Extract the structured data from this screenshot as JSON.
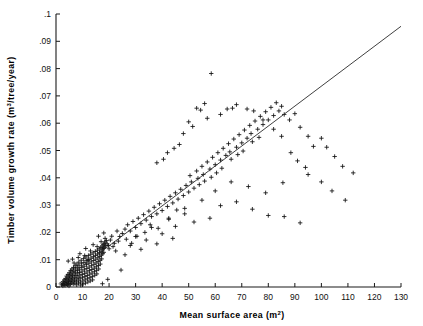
{
  "chart_data": {
    "type": "scatter",
    "title": "",
    "xlabel": "Mean surface area (m2)",
    "xlabel_base": "Mean surface area (m",
    "xlabel_sup": "2",
    "xlabel_tail": ")",
    "ylabel": "Timber volume growth rate (m3/tree/year)",
    "ylabel_base": "Timber volume growth rate (m",
    "ylabel_sup": "3",
    "ylabel_tail": "/tree/year)",
    "xlim": [
      0,
      130
    ],
    "ylim": [
      0,
      0.1
    ],
    "grid": false,
    "legend": null,
    "marker": "plus",
    "xticks": [
      0,
      10,
      20,
      30,
      40,
      50,
      60,
      70,
      80,
      90,
      100,
      110,
      120,
      130
    ],
    "xticklabels": [
      "0",
      "10",
      "20",
      "30",
      "40",
      "50",
      "60",
      "70",
      "80",
      "90",
      "100",
      "110",
      "120",
      "130"
    ],
    "yticks": [
      0,
      0.01,
      0.02,
      0.03,
      0.04,
      0.05,
      0.06,
      0.07,
      0.08,
      0.09,
      0.1
    ],
    "yticklabels": [
      "0",
      ".01",
      ".02",
      ".03",
      ".04",
      ".05",
      ".06",
      ".07",
      ".08",
      ".09",
      ".1"
    ],
    "fit_line": {
      "type": "linear",
      "x_start": 1.0,
      "y_start": 0.0012,
      "x_end": 130.0,
      "y_end": 0.0955,
      "slope": 0.000731,
      "intercept": 0.00047
    },
    "points": [
      [
        2.1,
        0.0008
      ],
      [
        2.4,
        0.0012
      ],
      [
        2.6,
        0.0004
      ],
      [
        2.8,
        0.0019
      ],
      [
        3.0,
        0.001
      ],
      [
        3.1,
        0.0026
      ],
      [
        3.3,
        0.0015
      ],
      [
        3.4,
        0.0006
      ],
      [
        3.6,
        0.0031
      ],
      [
        3.7,
        0.0021
      ],
      [
        3.9,
        0.0011
      ],
      [
        4.0,
        0.004
      ],
      [
        4.1,
        0.0028
      ],
      [
        4.2,
        0.0017
      ],
      [
        4.3,
        0.0008
      ],
      [
        4.5,
        0.0046
      ],
      [
        4.6,
        0.0034
      ],
      [
        4.7,
        0.0023
      ],
      [
        4.8,
        0.0013
      ],
      [
        4.9,
        0.0004
      ],
      [
        5.0,
        0.0052
      ],
      [
        5.1,
        0.0041
      ],
      [
        5.2,
        0.003
      ],
      [
        5.3,
        0.002
      ],
      [
        5.4,
        0.001
      ],
      [
        5.5,
        0.006
      ],
      [
        5.6,
        0.0048
      ],
      [
        5.7,
        0.0037
      ],
      [
        5.8,
        0.0026
      ],
      [
        5.9,
        0.0015
      ],
      [
        6.0,
        0.0066
      ],
      [
        6.1,
        0.0055
      ],
      [
        6.2,
        0.0043
      ],
      [
        6.3,
        0.0032
      ],
      [
        6.4,
        0.0021
      ],
      [
        6.5,
        0.0011
      ],
      [
        6.6,
        0.0071
      ],
      [
        6.7,
        0.0059
      ],
      [
        6.8,
        0.0048
      ],
      [
        6.9,
        0.0036
      ],
      [
        7.0,
        0.0025
      ],
      [
        7.1,
        0.0014
      ],
      [
        7.2,
        0.0078
      ],
      [
        7.3,
        0.0066
      ],
      [
        7.4,
        0.0054
      ],
      [
        7.5,
        0.0042
      ],
      [
        7.6,
        0.003
      ],
      [
        7.7,
        0.0019
      ],
      [
        7.8,
        0.0008
      ],
      [
        7.9,
        0.0084
      ],
      [
        8.0,
        0.0072
      ],
      [
        8.1,
        0.006
      ],
      [
        8.2,
        0.0048
      ],
      [
        8.3,
        0.0036
      ],
      [
        8.4,
        0.0025
      ],
      [
        8.5,
        0.0014
      ],
      [
        8.6,
        0.0091
      ],
      [
        8.7,
        0.0078
      ],
      [
        8.8,
        0.0065
      ],
      [
        8.9,
        0.0053
      ],
      [
        9.0,
        0.0041
      ],
      [
        9.1,
        0.003
      ],
      [
        9.2,
        0.0018
      ],
      [
        9.3,
        0.0007
      ],
      [
        9.5,
        0.0098
      ],
      [
        9.6,
        0.0085
      ],
      [
        9.7,
        0.0071
      ],
      [
        9.8,
        0.0058
      ],
      [
        9.9,
        0.0046
      ],
      [
        10.0,
        0.0034
      ],
      [
        10.1,
        0.0022
      ],
      [
        10.2,
        0.0011
      ],
      [
        10.4,
        0.0104
      ],
      [
        10.5,
        0.009
      ],
      [
        10.6,
        0.0076
      ],
      [
        10.7,
        0.0063
      ],
      [
        10.8,
        0.005
      ],
      [
        10.9,
        0.0038
      ],
      [
        11.0,
        0.0026
      ],
      [
        11.1,
        0.0014
      ],
      [
        11.3,
        0.011
      ],
      [
        11.4,
        0.0096
      ],
      [
        11.5,
        0.0082
      ],
      [
        11.6,
        0.0068
      ],
      [
        11.7,
        0.0055
      ],
      [
        11.8,
        0.0042
      ],
      [
        11.9,
        0.003
      ],
      [
        12.0,
        0.0018
      ],
      [
        12.2,
        0.0115
      ],
      [
        12.3,
        0.0101
      ],
      [
        12.4,
        0.0087
      ],
      [
        12.5,
        0.0073
      ],
      [
        12.6,
        0.006
      ],
      [
        12.7,
        0.0047
      ],
      [
        12.8,
        0.0034
      ],
      [
        12.9,
        0.0022
      ],
      [
        13.1,
        0.012
      ],
      [
        13.2,
        0.0106
      ],
      [
        13.3,
        0.0092
      ],
      [
        13.4,
        0.0078
      ],
      [
        13.5,
        0.0064
      ],
      [
        13.6,
        0.0051
      ],
      [
        13.7,
        0.0038
      ],
      [
        13.8,
        0.0026
      ],
      [
        14.0,
        0.0125
      ],
      [
        14.1,
        0.0111
      ],
      [
        14.2,
        0.0097
      ],
      [
        14.3,
        0.0083
      ],
      [
        14.4,
        0.0069
      ],
      [
        14.5,
        0.0056
      ],
      [
        14.6,
        0.0043
      ],
      [
        14.8,
        0.013
      ],
      [
        14.9,
        0.0116
      ],
      [
        15.0,
        0.0102
      ],
      [
        15.1,
        0.0088
      ],
      [
        15.2,
        0.0074
      ],
      [
        15.3,
        0.0061
      ],
      [
        15.4,
        0.0048
      ],
      [
        15.6,
        0.0135
      ],
      [
        15.7,
        0.0121
      ],
      [
        15.8,
        0.0107
      ],
      [
        15.9,
        0.0093
      ],
      [
        16.0,
        0.0079
      ],
      [
        16.1,
        0.0066
      ],
      [
        16.3,
        0.014
      ],
      [
        16.4,
        0.0126
      ],
      [
        16.5,
        0.0112
      ],
      [
        16.6,
        0.0098
      ],
      [
        16.7,
        0.0084
      ],
      [
        16.9,
        0.0145
      ],
      [
        17.0,
        0.0131
      ],
      [
        17.1,
        0.0117
      ],
      [
        17.2,
        0.0103
      ],
      [
        17.4,
        0.015
      ],
      [
        17.5,
        0.0136
      ],
      [
        17.6,
        0.0122
      ],
      [
        17.8,
        0.0155
      ],
      [
        17.9,
        0.0141
      ],
      [
        18.0,
        0.0127
      ],
      [
        18.2,
        0.016
      ],
      [
        18.3,
        0.0146
      ],
      [
        18.5,
        0.0165
      ],
      [
        18.7,
        0.0151
      ],
      [
        19.0,
        0.017
      ],
      [
        19.3,
        0.0158
      ],
      [
        6.2,
        0.0102
      ],
      [
        8.4,
        0.0108
      ],
      [
        10.8,
        0.0115
      ],
      [
        13.0,
        0.0132
      ],
      [
        15.5,
        0.0148
      ],
      [
        17.0,
        0.0166
      ],
      [
        18.5,
        0.0178
      ],
      [
        19.8,
        0.0152
      ],
      [
        20.5,
        0.0172
      ],
      [
        21.0,
        0.0186
      ],
      [
        4.6,
        0.0095
      ],
      [
        6.8,
        0.0088
      ],
      [
        9.0,
        0.0122
      ],
      [
        11.2,
        0.0141
      ],
      [
        12.0,
        0.0098
      ],
      [
        14.0,
        0.0155
      ],
      [
        16.0,
        0.0186
      ],
      [
        18.0,
        0.0198
      ],
      [
        20.0,
        0.014
      ],
      [
        22.0,
        0.016
      ],
      [
        23.0,
        0.0205
      ],
      [
        24.0,
        0.0185
      ],
      [
        24.5,
        0.0062
      ],
      [
        19.5,
        0.0028
      ],
      [
        17.5,
        0.0012
      ],
      [
        21.5,
        0.0148
      ],
      [
        22.5,
        0.0132
      ],
      [
        23.5,
        0.0168
      ],
      [
        25.0,
        0.0196
      ],
      [
        26.0,
        0.0212
      ],
      [
        26.5,
        0.0175
      ],
      [
        27.0,
        0.0228
      ],
      [
        28.0,
        0.0205
      ],
      [
        28.5,
        0.016
      ],
      [
        29.0,
        0.024
      ],
      [
        30.0,
        0.0218
      ],
      [
        30.5,
        0.0186
      ],
      [
        31.0,
        0.0252
      ],
      [
        32.0,
        0.0232
      ],
      [
        33.0,
        0.0265
      ],
      [
        33.5,
        0.02
      ],
      [
        34.0,
        0.0245
      ],
      [
        35.0,
        0.0278
      ],
      [
        35.5,
        0.0228
      ],
      [
        36.0,
        0.0258
      ],
      [
        37.0,
        0.0292
      ],
      [
        38.0,
        0.0268
      ],
      [
        38.5,
        0.0215
      ],
      [
        39.0,
        0.0305
      ],
      [
        40.0,
        0.028
      ],
      [
        41.0,
        0.0318
      ],
      [
        42.0,
        0.0295
      ],
      [
        42.5,
        0.0248
      ],
      [
        43.0,
        0.0332
      ],
      [
        44.0,
        0.0308
      ],
      [
        45.0,
        0.0345
      ],
      [
        45.5,
        0.0282
      ],
      [
        46.0,
        0.0322
      ],
      [
        47.0,
        0.0358
      ],
      [
        48.0,
        0.0335
      ],
      [
        48.5,
        0.0268
      ],
      [
        49.0,
        0.0372
      ],
      [
        50.0,
        0.0348
      ],
      [
        50.5,
        0.0408
      ],
      [
        51.0,
        0.0385
      ],
      [
        52.0,
        0.0362
      ],
      [
        53.0,
        0.0425
      ],
      [
        53.5,
        0.0398
      ],
      [
        54.0,
        0.0375
      ],
      [
        55.0,
        0.0442
      ],
      [
        55.5,
        0.0412
      ],
      [
        56.0,
        0.0388
      ],
      [
        57.0,
        0.0458
      ],
      [
        58.0,
        0.0432
      ],
      [
        58.5,
        0.0402
      ],
      [
        59.0,
        0.0475
      ],
      [
        60.0,
        0.0448
      ],
      [
        60.5,
        0.0418
      ],
      [
        61.0,
        0.0492
      ],
      [
        62.0,
        0.0465
      ],
      [
        62.5,
        0.0435
      ],
      [
        63.0,
        0.0508
      ],
      [
        64.0,
        0.0482
      ],
      [
        65.0,
        0.0525
      ],
      [
        65.5,
        0.0495
      ],
      [
        66.0,
        0.0468
      ],
      [
        67.0,
        0.0542
      ],
      [
        68.0,
        0.0512
      ],
      [
        68.5,
        0.0485
      ],
      [
        69.0,
        0.0558
      ],
      [
        70.0,
        0.0528
      ],
      [
        70.5,
        0.0498
      ],
      [
        71.0,
        0.0575
      ],
      [
        72.0,
        0.0545
      ],
      [
        73.0,
        0.0592
      ],
      [
        73.5,
        0.0562
      ],
      [
        74.0,
        0.0532
      ],
      [
        75.0,
        0.0608
      ],
      [
        76.0,
        0.0578
      ],
      [
        76.5,
        0.0548
      ],
      [
        77.0,
        0.0625
      ],
      [
        78.0,
        0.0595
      ],
      [
        79.0,
        0.0642
      ],
      [
        80.0,
        0.0612
      ],
      [
        81.0,
        0.0658
      ],
      [
        82.0,
        0.0628
      ],
      [
        83.0,
        0.0675
      ],
      [
        84.0,
        0.0645
      ],
      [
        85.0,
        0.0662
      ],
      [
        86.0,
        0.0632
      ],
      [
        58.5,
        0.0782
      ],
      [
        53.0,
        0.0655
      ],
      [
        54.5,
        0.0648
      ],
      [
        56.0,
        0.0672
      ],
      [
        48.0,
        0.0562
      ],
      [
        42.0,
        0.0492
      ],
      [
        44.5,
        0.0508
      ],
      [
        46.5,
        0.0522
      ],
      [
        38.0,
        0.0455
      ],
      [
        40.5,
        0.0468
      ],
      [
        50.0,
        0.0605
      ],
      [
        51.5,
        0.0588
      ],
      [
        57.0,
        0.0618
      ],
      [
        62.0,
        0.0632
      ],
      [
        64.5,
        0.0652
      ],
      [
        66.5,
        0.0655
      ],
      [
        68.0,
        0.0668
      ],
      [
        72.0,
        0.0652
      ],
      [
        74.5,
        0.0645
      ],
      [
        78.0,
        0.0612
      ],
      [
        82.0,
        0.0578
      ],
      [
        85.0,
        0.0552
      ],
      [
        88.0,
        0.0612
      ],
      [
        90.0,
        0.0635
      ],
      [
        92.0,
        0.0585
      ],
      [
        95.0,
        0.0552
      ],
      [
        97.0,
        0.0515
      ],
      [
        100.0,
        0.0545
      ],
      [
        102.0,
        0.0512
      ],
      [
        105.0,
        0.0478
      ],
      [
        108.0,
        0.0442
      ],
      [
        112.0,
        0.0418
      ],
      [
        88.5,
        0.0492
      ],
      [
        91.0,
        0.0462
      ],
      [
        94.0,
        0.0438
      ],
      [
        85.5,
        0.0382
      ],
      [
        79.0,
        0.0345
      ],
      [
        72.5,
        0.0368
      ],
      [
        66.0,
        0.0385
      ],
      [
        60.0,
        0.0352
      ],
      [
        55.0,
        0.0318
      ],
      [
        48.5,
        0.0288
      ],
      [
        42.5,
        0.0252
      ],
      [
        36.0,
        0.0218
      ],
      [
        30.0,
        0.0185
      ],
      [
        62.0,
        0.0298
      ],
      [
        68.0,
        0.0312
      ],
      [
        74.0,
        0.0285
      ],
      [
        80.0,
        0.0262
      ],
      [
        95.0,
        0.0412
      ],
      [
        100.0,
        0.0385
      ],
      [
        104.0,
        0.0352
      ],
      [
        109.0,
        0.0318
      ],
      [
        86.0,
        0.0258
      ],
      [
        92.0,
        0.0235
      ],
      [
        45.0,
        0.0222
      ],
      [
        52.0,
        0.0238
      ],
      [
        58.0,
        0.0252
      ],
      [
        40.0,
        0.0195
      ],
      [
        34.0,
        0.0172
      ],
      [
        28.0,
        0.0152
      ],
      [
        26.0,
        0.0118
      ],
      [
        32.0,
        0.0138
      ],
      [
        38.0,
        0.0158
      ],
      [
        44.0,
        0.0178
      ]
    ]
  }
}
